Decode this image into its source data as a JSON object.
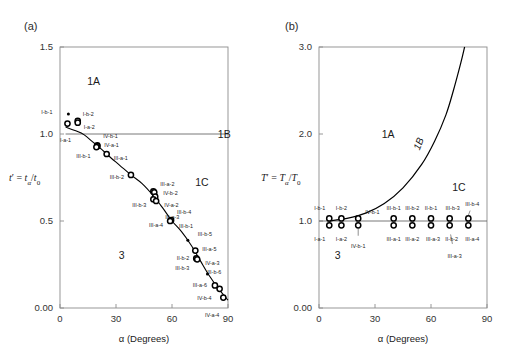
{
  "figure": {
    "width": 515,
    "height": 360,
    "background": "#ffffff",
    "line_color": "#000000",
    "frame_color": "#8c8c8c",
    "text_color": "#1a1a1a"
  },
  "panel_a": {
    "panel_label": "(a)",
    "axes": {
      "x_title": "α (Degrees)",
      "x_ticks": [
        "0",
        "30",
        "60",
        "90"
      ],
      "x_tick_values": [
        0,
        30,
        60,
        90
      ],
      "x_range": [
        0,
        90
      ],
      "y_title_full": "t' = tα/t0",
      "y_title_parts": {
        "symbol": "t",
        "prime": "′",
        "equals": "=",
        "num": "t",
        "num_sub": "α",
        "slash": "/",
        "den": "t",
        "den_sub": "0"
      },
      "y_ticks": [
        "0.00",
        "0.5",
        "1.0",
        "1.5"
      ],
      "y_tick_values": [
        0.0,
        0.5,
        1.0,
        1.5
      ],
      "y_range": [
        0,
        1.5
      ]
    },
    "regions": [
      {
        "label": "1A",
        "x": 18,
        "y": 1.3
      },
      {
        "label": "1B",
        "x": 88,
        "y": 1.0
      },
      {
        "label": "1C",
        "x": 76,
        "y": 0.72
      },
      {
        "label": "3",
        "x": 33,
        "y": 0.3
      }
    ],
    "boundary_line": {
      "label": "1B",
      "y": 1.0,
      "x_from": 3,
      "x_to": 90
    },
    "points": [
      {
        "id": "I-b-1",
        "x": 4.5,
        "y": 1.115,
        "marker": "small",
        "label_dx": -16,
        "label_dy": -2,
        "anchor": "end"
      },
      {
        "id": "I-b-2",
        "x": 9.5,
        "y": 1.075,
        "marker": "open",
        "label_dx": 5,
        "label_dy": -7,
        "anchor": "start"
      },
      {
        "id": "I-a-2",
        "x": 9.5,
        "y": 1.065,
        "marker": "open",
        "label_dx": 6,
        "label_dy": 4,
        "anchor": "start"
      },
      {
        "id": "I-a-1",
        "x": 4.0,
        "y": 1.06,
        "marker": "open",
        "label_dx": -2,
        "label_dy": 16,
        "anchor": "middle"
      },
      {
        "id": "IV-b-1",
        "x": 20.0,
        "y": 0.935,
        "marker": "open",
        "label_dx": 6,
        "label_dy": -10,
        "anchor": "start"
      },
      {
        "id": "IV-a-1",
        "x": 20.0,
        "y": 0.93,
        "marker": "open",
        "label_dx": 7,
        "label_dy": -1,
        "anchor": "start"
      },
      {
        "id": "III-b-1",
        "x": 19.5,
        "y": 0.925,
        "marker": "open",
        "label_dx": -6,
        "label_dy": 9,
        "anchor": "end"
      },
      {
        "id": "III-a-1",
        "x": 25.0,
        "y": 0.885,
        "marker": "open",
        "label_dx": 7,
        "label_dy": 4,
        "anchor": "start"
      },
      {
        "id": "III-b-2",
        "x": 38.0,
        "y": 0.765,
        "marker": "open",
        "label_dx": -7,
        "label_dy": 2,
        "anchor": "end"
      },
      {
        "id": "III-a-2",
        "x": 50.0,
        "y": 0.67,
        "marker": "open",
        "label_dx": 7,
        "label_dy": -8,
        "anchor": "start"
      },
      {
        "id": "IV-b-2",
        "x": 50.5,
        "y": 0.665,
        "marker": "open",
        "label_dx": 9,
        "label_dy": 0,
        "anchor": "start"
      },
      {
        "id": "IV-a-2",
        "x": 51.0,
        "y": 0.64,
        "marker": "open",
        "label_dx": 9,
        "label_dy": 8,
        "anchor": "start"
      },
      {
        "id": "III-b-3",
        "x": 50.0,
        "y": 0.625,
        "marker": "open",
        "label_dx": -7,
        "label_dy": 5,
        "anchor": "end"
      },
      {
        "id": "III-a-3",
        "x": 51.5,
        "y": 0.615,
        "marker": "open",
        "label_dx": 9,
        "label_dy": 16,
        "anchor": "start"
      },
      {
        "id": "III-b-4",
        "x": 59.5,
        "y": 0.505,
        "marker": "open",
        "label_dx": 6,
        "label_dy": -8,
        "anchor": "start"
      },
      {
        "id": "III-a-4",
        "x": 59.0,
        "y": 0.5,
        "marker": "open",
        "label_dx": -7,
        "label_dy": 4,
        "anchor": "end"
      },
      {
        "id": "III-b-1b",
        "x": 60.0,
        "y": 0.495,
        "marker": "none",
        "label_text": "III-b-1",
        "label_dx": 7,
        "label_dy": 4,
        "anchor": "start"
      },
      {
        "id": "III-b-5",
        "x": 68.5,
        "y": 0.39,
        "marker": "small",
        "label_dx": 10,
        "label_dy": -6,
        "anchor": "start"
      },
      {
        "id": "III-a-5",
        "x": 72.5,
        "y": 0.33,
        "marker": "open",
        "label_dx": 7,
        "label_dy": -2,
        "anchor": "start"
      },
      {
        "id": "II-b-2",
        "x": 73.0,
        "y": 0.285,
        "marker": "open",
        "label_dx": -7,
        "label_dy": -1,
        "anchor": "end"
      },
      {
        "id": "IV-a-3",
        "x": 73.5,
        "y": 0.28,
        "marker": "open",
        "label_dx": 8,
        "label_dy": 3,
        "anchor": "start"
      },
      {
        "id": "III-b-3b",
        "x": 73.0,
        "y": 0.275,
        "marker": "none",
        "label_text": "III-b-3",
        "label_dx": -7,
        "label_dy": 8,
        "anchor": "end"
      },
      {
        "id": "III-b-6",
        "x": 74.0,
        "y": 0.272,
        "marker": "none",
        "label_text": "III-b-6",
        "label_dx": 9,
        "label_dy": 11,
        "anchor": "start"
      },
      {
        "id": "pt-small-1",
        "x": 79.0,
        "y": 0.195,
        "marker": "small",
        "label_text": "",
        "label_dx": 0,
        "label_dy": 0,
        "anchor": "start"
      },
      {
        "id": "III-a-6",
        "x": 83.0,
        "y": 0.13,
        "marker": "open",
        "label_dx": -8,
        "label_dy": -1,
        "anchor": "end"
      },
      {
        "id": "IV-b-4",
        "x": 85.5,
        "y": 0.11,
        "marker": "open",
        "label_dx": -8,
        "label_dy": 9,
        "anchor": "end"
      },
      {
        "id": "IV-a-4",
        "x": 87.5,
        "y": 0.06,
        "marker": "open",
        "label_dx": -4,
        "label_dy": 17,
        "anchor": "end"
      }
    ],
    "curve": [
      {
        "x": 3,
        "y": 1.04
      },
      {
        "x": 8,
        "y": 1.02
      },
      {
        "x": 13,
        "y": 0.995
      },
      {
        "x": 18,
        "y": 0.95
      },
      {
        "x": 22,
        "y": 0.915
      },
      {
        "x": 26,
        "y": 0.875
      },
      {
        "x": 32,
        "y": 0.82
      },
      {
        "x": 38,
        "y": 0.765
      },
      {
        "x": 44,
        "y": 0.715
      },
      {
        "x": 50,
        "y": 0.645
      },
      {
        "x": 55,
        "y": 0.575
      },
      {
        "x": 60,
        "y": 0.5
      },
      {
        "x": 65,
        "y": 0.44
      },
      {
        "x": 70,
        "y": 0.365
      },
      {
        "x": 75,
        "y": 0.275
      },
      {
        "x": 80,
        "y": 0.185
      },
      {
        "x": 85,
        "y": 0.11
      },
      {
        "x": 90,
        "y": 0.045
      }
    ]
  },
  "panel_b": {
    "panel_label": "(b)",
    "axes": {
      "x_title": "α (Degrees)",
      "x_ticks": [
        "0",
        "30",
        "60",
        "90"
      ],
      "x_tick_values": [
        0,
        30,
        60,
        90
      ],
      "x_range": [
        0,
        90
      ],
      "y_title_full": "T' = Tα/T0",
      "y_title_parts": {
        "symbol": "T",
        "prime": "′",
        "equals": "=",
        "num": "T",
        "num_sub": "α",
        "slash": "/",
        "den": "T",
        "den_sub": "0"
      },
      "y_ticks": [
        "0.00",
        "1.0",
        "2.0",
        "3.0"
      ],
      "y_tick_values": [
        0.0,
        1.0,
        2.0,
        3.0
      ],
      "y_range": [
        0,
        3.0
      ]
    },
    "regions": [
      {
        "label": "1A",
        "x": 37,
        "y": 2.0
      },
      {
        "label": "1C",
        "x": 75,
        "y": 1.38
      },
      {
        "label": "3",
        "x": 10,
        "y": 0.6
      }
    ],
    "boundary_line": {
      "label": "1B",
      "y": 1.0,
      "x_from": 0,
      "x_to": 90
    },
    "boundary_curve_label": "1B",
    "boundary_curve": [
      {
        "x": 5,
        "y": 1.0
      },
      {
        "x": 15,
        "y": 1.03
      },
      {
        "x": 25,
        "y": 1.09
      },
      {
        "x": 35,
        "y": 1.2
      },
      {
        "x": 45,
        "y": 1.38
      },
      {
        "x": 55,
        "y": 1.65
      },
      {
        "x": 62,
        "y": 1.92
      },
      {
        "x": 68,
        "y": 2.22
      },
      {
        "x": 72,
        "y": 2.5
      },
      {
        "x": 76,
        "y": 2.82
      },
      {
        "x": 78,
        "y": 3.0
      }
    ],
    "points": [
      {
        "id": "I-b-1",
        "x": 5.5,
        "y": 1.03,
        "marker": "open",
        "label_dx": -4,
        "label_dy": -11,
        "anchor": "end"
      },
      {
        "id": "I-a-1",
        "x": 5.5,
        "y": 0.95,
        "marker": "open",
        "label_dx": -4,
        "label_dy": 13,
        "anchor": "end"
      },
      {
        "id": "I-b-2",
        "x": 12.0,
        "y": 1.03,
        "marker": "open",
        "label_dx": 0,
        "label_dy": -11,
        "anchor": "middle"
      },
      {
        "id": "I-a-2",
        "x": 12.0,
        "y": 0.95,
        "marker": "open",
        "label_dx": 0,
        "label_dy": 13,
        "anchor": "middle"
      },
      {
        "id": "IV-b-1t",
        "x": 21.0,
        "y": 1.03,
        "marker": "open",
        "label_text": "IV-b-1",
        "label_dx": 7,
        "label_dy": -7,
        "anchor": "start"
      },
      {
        "id": "IV-b-1b",
        "x": 21.0,
        "y": 0.95,
        "marker": "open",
        "label_text": "IV-b-1",
        "label_dx": 0,
        "label_dy": 20,
        "anchor": "middle",
        "leader": true
      },
      {
        "id": "III-b-1",
        "x": 40.0,
        "y": 1.03,
        "marker": "open",
        "label_dx": 0,
        "label_dy": -11,
        "anchor": "middle"
      },
      {
        "id": "III-a-1",
        "x": 40.0,
        "y": 0.95,
        "marker": "open",
        "label_dx": 0,
        "label_dy": 13,
        "anchor": "middle"
      },
      {
        "id": "III-b-2",
        "x": 50.0,
        "y": 1.03,
        "marker": "open",
        "label_dx": 0,
        "label_dy": -11,
        "anchor": "middle"
      },
      {
        "id": "III-a-2",
        "x": 50.0,
        "y": 0.95,
        "marker": "open",
        "label_dx": 0,
        "label_dy": 13,
        "anchor": "middle"
      },
      {
        "id": "II-b-1",
        "x": 60.0,
        "y": 1.03,
        "marker": "open",
        "label_dx": 0,
        "label_dy": -11,
        "anchor": "middle"
      },
      {
        "id": "III-a-3",
        "x": 60.0,
        "y": 0.95,
        "marker": "open",
        "label_dx": 2,
        "label_dy": 13,
        "anchor": "middle"
      },
      {
        "id": "III-b-3",
        "x": 70.0,
        "y": 1.03,
        "marker": "open",
        "label_dx": 3,
        "label_dy": -11,
        "anchor": "middle"
      },
      {
        "id": "II-b-2",
        "x": 70.0,
        "y": 0.95,
        "marker": "open",
        "label_dx": 2,
        "label_dy": 13,
        "anchor": "middle"
      },
      {
        "id": "III-a-3b",
        "x": 70.5,
        "y": 0.88,
        "marker": "none",
        "label_text": "III-a-3",
        "label_dx": 4,
        "label_dy": 24,
        "anchor": "middle",
        "leader": true
      },
      {
        "id": "III-b-4",
        "x": 80.0,
        "y": 1.03,
        "marker": "open",
        "label_dx": 4,
        "label_dy": -15,
        "anchor": "middle",
        "leader": true
      },
      {
        "id": "III-a-4",
        "x": 80.0,
        "y": 0.95,
        "marker": "open",
        "label_dx": 4,
        "label_dy": 13,
        "anchor": "middle"
      }
    ]
  }
}
